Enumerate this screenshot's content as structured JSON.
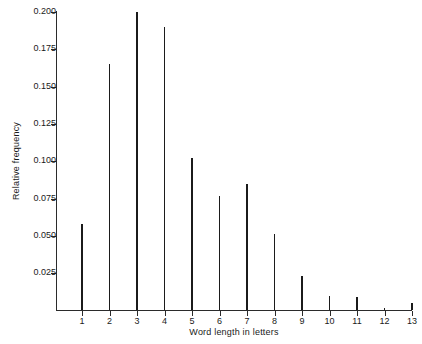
{
  "chart_data": {
    "type": "bar",
    "title": "",
    "subtitle": "",
    "xlabel": "Word length in letters",
    "ylabel": "Relative frequency",
    "categories": [
      "1",
      "2",
      "3",
      "4",
      "5",
      "6",
      "7",
      "8",
      "9",
      "10",
      "11",
      "12",
      "13"
    ],
    "values": [
      0.058,
      0.165,
      0.2,
      0.19,
      0.102,
      0.077,
      0.085,
      0.051,
      0.023,
      0.01,
      0.009,
      0.002,
      0.005
    ],
    "x": [
      1,
      2,
      3,
      4,
      5,
      6,
      7,
      8,
      9,
      10,
      11,
      12,
      13
    ],
    "xlim": [
      0.4,
      13.6
    ],
    "ylim": [
      0,
      0.208
    ],
    "ytick_labels": [
      "0.025",
      "0.050",
      "0.075",
      "0.100",
      "0.125",
      "0.150",
      "0.175",
      "0.200"
    ],
    "ytick_values": [
      0.025,
      0.05,
      0.075,
      0.1,
      0.125,
      0.15,
      0.175,
      0.2
    ],
    "xtick_labels": [
      "1",
      "2",
      "3",
      "4",
      "5",
      "6",
      "7",
      "8",
      "9",
      "10",
      "11",
      "12",
      "13"
    ],
    "grid": false,
    "legend": null,
    "legend_position": "none",
    "series_color": "#1b1b1b",
    "axis_color": "#2b2b2b",
    "background": "#ffffff"
  }
}
